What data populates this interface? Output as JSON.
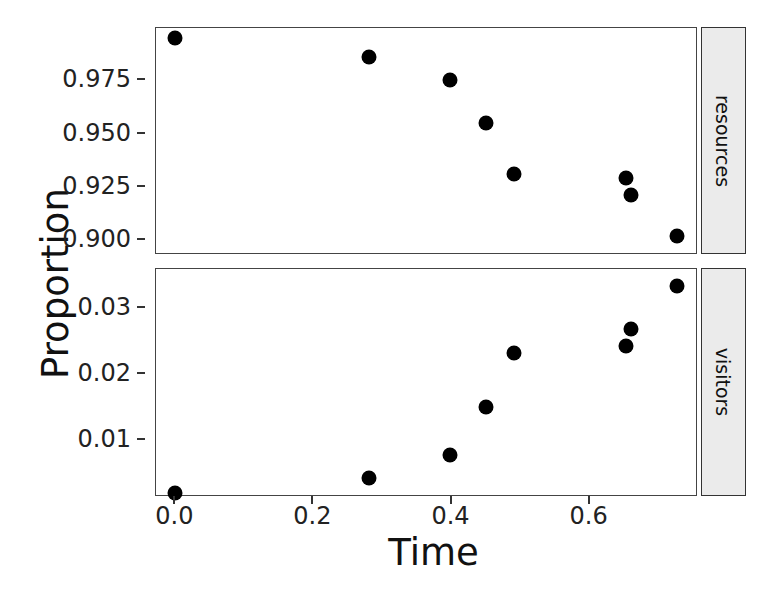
{
  "figure": {
    "ylabel": "Proportion",
    "xlabel": "Time"
  },
  "panels": [
    {
      "strip_label": "resources"
    },
    {
      "strip_label": "visitors"
    }
  ],
  "axis": {
    "x_ticks": [
      "0.0",
      "0.2",
      "0.4",
      "0.6"
    ],
    "x_tick_values": [
      0.0,
      0.2,
      0.4,
      0.6
    ],
    "y_ticks_resources": [
      "0.975",
      "0.950",
      "0.925",
      "0.900"
    ],
    "y_tick_values_resources": [
      0.975,
      0.95,
      0.925,
      0.9
    ],
    "y_ticks_visitors": [
      "0.03",
      "0.02",
      "0.01"
    ],
    "y_tick_values_visitors": [
      0.03,
      0.02,
      0.01
    ]
  },
  "chart_data": {
    "type": "scatter",
    "title": "",
    "xlabel": "Time",
    "ylabel": "Proportion",
    "grid": false,
    "legend": "none",
    "facet_variable": "category",
    "facet_strip_position": "right",
    "marker": {
      "shape": "circle",
      "color": "#000000",
      "size": 15
    },
    "panels": [
      {
        "name": "resources",
        "strip_label": "resources",
        "ylim": [
          0.893,
          0.9995
        ],
        "xlim": [
          -0.028,
          0.757
        ],
        "yticks": [
          0.975,
          0.95,
          0.925,
          0.9
        ],
        "ytick_labels": [
          "0.975",
          "0.950",
          "0.925",
          "0.900"
        ],
        "x": [
          0.0,
          0.281,
          0.398,
          0.45,
          0.491,
          0.653,
          0.66,
          0.727
        ],
        "y": [
          0.995,
          0.986,
          0.975,
          0.955,
          0.931,
          0.929,
          0.921,
          0.902
        ]
      },
      {
        "name": "visitors",
        "strip_label": "visitors",
        "ylim": [
          0.0015,
          0.0358
        ],
        "xlim": [
          -0.028,
          0.757
        ],
        "yticks": [
          0.03,
          0.02,
          0.01
        ],
        "ytick_labels": [
          "0.03",
          "0.02",
          "0.01"
        ],
        "x": [
          0.0,
          0.281,
          0.398,
          0.45,
          0.491,
          0.653,
          0.66,
          0.727
        ],
        "y": [
          0.0021,
          0.0044,
          0.0078,
          0.015,
          0.0232,
          0.0242,
          0.0268,
          0.0332
        ]
      }
    ]
  }
}
